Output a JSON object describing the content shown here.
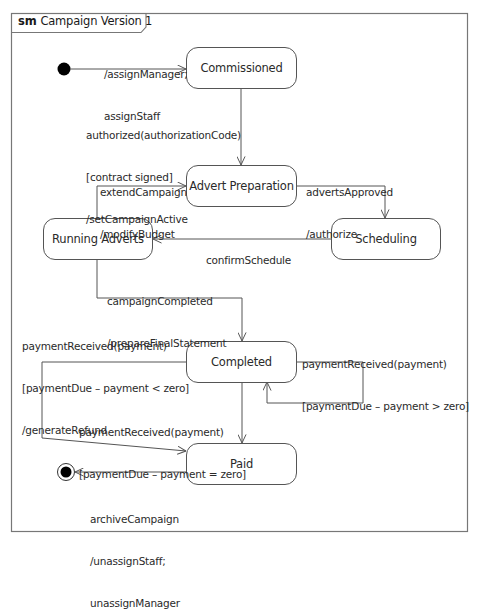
{
  "frame": {
    "keyword": "sm",
    "name": "Campaign Version 1"
  },
  "states": {
    "commissioned": "Commissioned",
    "advert_preparation": "Advert Preparation",
    "scheduling": "Scheduling",
    "running_adverts": "Running Adverts",
    "completed": "Completed",
    "paid": "Paid"
  },
  "transitions": {
    "initial_to_commissioned": [
      "/assignManager;",
      "assignStaff"
    ],
    "commissioned_to_advert_preparation": [
      "authorized(authorizationCode)",
      "[contract signed]",
      "/setCampaignActive"
    ],
    "running_to_advert_preparation": [
      "extendCampaign",
      "/modifyBudget"
    ],
    "advert_preparation_to_scheduling": [
      "advertsApproved",
      "/authorize"
    ],
    "scheduling_to_running": [
      "confirmSchedule"
    ],
    "running_to_completed": [
      "campaignCompleted",
      "/prepareFinalStatement"
    ],
    "completed_to_paid_refund": [
      "paymentReceived(payment)",
      "[paymentDue – payment < zero]",
      "/generateRefund"
    ],
    "completed_self_loop": [
      "paymentReceived(payment)",
      "[paymentDue – payment > zero]"
    ],
    "completed_to_paid": [
      "paymentReceived(payment)",
      "[paymentDue – payment = zero]"
    ],
    "paid_to_final": [
      "archiveCampaign",
      "/unassignStaff;",
      "unassignManager"
    ]
  },
  "colors": {
    "line": "#555555",
    "frame": "#777777",
    "text": "#2a2a2a",
    "background": "#ffffff"
  }
}
